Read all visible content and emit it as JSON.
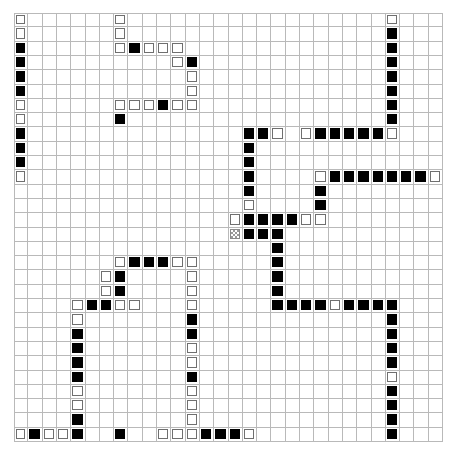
{
  "canvas": {
    "width": 457,
    "height": 463,
    "background": "#ffffff"
  },
  "grid": {
    "name": "puzzle-grid",
    "columns": 30,
    "rows": 30,
    "origin_x": 14,
    "origin_y": 13,
    "cell_size": 14.3,
    "line_color": "#b9b9b9",
    "legend": {
      "0": "empty",
      "1": "black-filled",
      "2": "white-outlined",
      "3": "gray-hatched"
    },
    "colors": {
      "black": "#000000",
      "white_fill": "#ffffff",
      "white_stroke": "#6f6f6f",
      "gray_hatch": "#9a9a9a",
      "gridline": "#b9b9b9"
    },
    "cells": [
      [
        2,
        0,
        0,
        0,
        0,
        0,
        0,
        2,
        0,
        0,
        0,
        0,
        0,
        0,
        0,
        0,
        0,
        0,
        0,
        0,
        0,
        0,
        0,
        0,
        0,
        0,
        2,
        0,
        0,
        0
      ],
      [
        2,
        0,
        0,
        0,
        0,
        0,
        0,
        2,
        0,
        0,
        0,
        0,
        0,
        0,
        0,
        0,
        0,
        0,
        0,
        0,
        0,
        0,
        0,
        0,
        0,
        0,
        1,
        0,
        0,
        0
      ],
      [
        1,
        0,
        0,
        0,
        0,
        0,
        0,
        2,
        1,
        2,
        2,
        2,
        0,
        0,
        0,
        0,
        0,
        0,
        0,
        0,
        0,
        0,
        0,
        0,
        0,
        0,
        1,
        0,
        0,
        0
      ],
      [
        1,
        0,
        0,
        0,
        0,
        0,
        0,
        0,
        0,
        0,
        0,
        2,
        1,
        0,
        0,
        0,
        0,
        0,
        0,
        0,
        0,
        0,
        0,
        0,
        0,
        0,
        1,
        0,
        0,
        0
      ],
      [
        1,
        0,
        0,
        0,
        0,
        0,
        0,
        0,
        0,
        0,
        0,
        0,
        2,
        0,
        0,
        0,
        0,
        0,
        0,
        0,
        0,
        0,
        0,
        0,
        0,
        0,
        1,
        0,
        0,
        0
      ],
      [
        1,
        0,
        0,
        0,
        0,
        0,
        0,
        0,
        0,
        0,
        0,
        0,
        2,
        0,
        0,
        0,
        0,
        0,
        0,
        0,
        0,
        0,
        0,
        0,
        0,
        0,
        1,
        0,
        0,
        0
      ],
      [
        2,
        0,
        0,
        0,
        0,
        0,
        0,
        2,
        2,
        2,
        1,
        2,
        2,
        0,
        0,
        0,
        0,
        0,
        0,
        0,
        0,
        0,
        0,
        0,
        0,
        0,
        1,
        0,
        0,
        0
      ],
      [
        2,
        0,
        0,
        0,
        0,
        0,
        0,
        1,
        0,
        0,
        0,
        0,
        0,
        0,
        0,
        0,
        0,
        0,
        0,
        0,
        0,
        0,
        0,
        0,
        0,
        0,
        1,
        0,
        0,
        0
      ],
      [
        1,
        0,
        0,
        0,
        0,
        0,
        0,
        0,
        0,
        0,
        0,
        0,
        0,
        0,
        0,
        0,
        1,
        1,
        2,
        0,
        2,
        1,
        1,
        1,
        1,
        1,
        2,
        0,
        0,
        0
      ],
      [
        1,
        0,
        0,
        0,
        0,
        0,
        0,
        0,
        0,
        0,
        0,
        0,
        0,
        0,
        0,
        0,
        1,
        0,
        0,
        0,
        0,
        0,
        0,
        0,
        0,
        0,
        0,
        0,
        0,
        0
      ],
      [
        1,
        0,
        0,
        0,
        0,
        0,
        0,
        0,
        0,
        0,
        0,
        0,
        0,
        0,
        0,
        0,
        1,
        0,
        0,
        0,
        0,
        0,
        0,
        0,
        0,
        0,
        0,
        0,
        0,
        0
      ],
      [
        2,
        0,
        0,
        0,
        0,
        0,
        0,
        0,
        0,
        0,
        0,
        0,
        0,
        0,
        0,
        0,
        1,
        0,
        0,
        0,
        0,
        2,
        1,
        1,
        1,
        1,
        1,
        1,
        1,
        2
      ],
      [
        0,
        0,
        0,
        0,
        0,
        0,
        0,
        0,
        0,
        0,
        0,
        0,
        0,
        0,
        0,
        0,
        1,
        0,
        0,
        0,
        0,
        1,
        0,
        0,
        0,
        0,
        0,
        0,
        0,
        0
      ],
      [
        0,
        0,
        0,
        0,
        0,
        0,
        0,
        0,
        0,
        0,
        0,
        0,
        0,
        0,
        0,
        0,
        2,
        0,
        0,
        0,
        0,
        1,
        0,
        0,
        0,
        0,
        0,
        0,
        0,
        0
      ],
      [
        0,
        0,
        0,
        0,
        0,
        0,
        0,
        0,
        0,
        0,
        0,
        0,
        0,
        0,
        0,
        2,
        1,
        1,
        1,
        1,
        2,
        2,
        0,
        0,
        0,
        0,
        0,
        0,
        0,
        0
      ],
      [
        0,
        0,
        0,
        0,
        0,
        0,
        0,
        0,
        0,
        0,
        0,
        0,
        0,
        0,
        0,
        3,
        1,
        1,
        1,
        0,
        0,
        0,
        0,
        0,
        0,
        0,
        0,
        0,
        0,
        0
      ],
      [
        0,
        0,
        0,
        0,
        0,
        0,
        0,
        0,
        0,
        0,
        0,
        0,
        0,
        0,
        0,
        0,
        0,
        0,
        1,
        0,
        0,
        0,
        0,
        0,
        0,
        0,
        0,
        0,
        0,
        0
      ],
      [
        0,
        0,
        0,
        0,
        0,
        0,
        0,
        2,
        1,
        1,
        1,
        2,
        2,
        0,
        0,
        0,
        0,
        0,
        1,
        0,
        0,
        0,
        0,
        0,
        0,
        0,
        0,
        0,
        0,
        0
      ],
      [
        0,
        0,
        0,
        0,
        0,
        0,
        2,
        1,
        0,
        0,
        0,
        0,
        2,
        0,
        0,
        0,
        0,
        0,
        1,
        0,
        0,
        0,
        0,
        0,
        0,
        0,
        0,
        0,
        0,
        0
      ],
      [
        0,
        0,
        0,
        0,
        0,
        0,
        2,
        1,
        0,
        0,
        0,
        0,
        2,
        0,
        0,
        0,
        0,
        0,
        1,
        0,
        0,
        0,
        0,
        0,
        0,
        0,
        0,
        0,
        0,
        0
      ],
      [
        0,
        0,
        0,
        0,
        2,
        1,
        1,
        2,
        2,
        0,
        0,
        0,
        2,
        0,
        0,
        0,
        0,
        0,
        1,
        1,
        1,
        1,
        2,
        1,
        1,
        1,
        1,
        0,
        0,
        0
      ],
      [
        0,
        0,
        0,
        0,
        2,
        0,
        0,
        0,
        0,
        0,
        0,
        0,
        1,
        0,
        0,
        0,
        0,
        0,
        0,
        0,
        0,
        0,
        0,
        0,
        0,
        0,
        1,
        0,
        0,
        0
      ],
      [
        0,
        0,
        0,
        0,
        1,
        0,
        0,
        0,
        0,
        0,
        0,
        0,
        1,
        0,
        0,
        0,
        0,
        0,
        0,
        0,
        0,
        0,
        0,
        0,
        0,
        0,
        1,
        0,
        0,
        0
      ],
      [
        0,
        0,
        0,
        0,
        1,
        0,
        0,
        0,
        0,
        0,
        0,
        0,
        2,
        0,
        0,
        0,
        0,
        0,
        0,
        0,
        0,
        0,
        0,
        0,
        0,
        0,
        1,
        0,
        0,
        0
      ],
      [
        0,
        0,
        0,
        0,
        1,
        0,
        0,
        0,
        0,
        0,
        0,
        0,
        2,
        0,
        0,
        0,
        0,
        0,
        0,
        0,
        0,
        0,
        0,
        0,
        0,
        0,
        1,
        0,
        0,
        0
      ],
      [
        0,
        0,
        0,
        0,
        1,
        0,
        0,
        0,
        0,
        0,
        0,
        0,
        1,
        0,
        0,
        0,
        0,
        0,
        0,
        0,
        0,
        0,
        0,
        0,
        0,
        0,
        2,
        0,
        0,
        0
      ],
      [
        0,
        0,
        0,
        0,
        2,
        0,
        0,
        0,
        0,
        0,
        0,
        0,
        2,
        0,
        0,
        0,
        0,
        0,
        0,
        0,
        0,
        0,
        0,
        0,
        0,
        0,
        1,
        0,
        0,
        0
      ],
      [
        0,
        0,
        0,
        0,
        2,
        0,
        0,
        0,
        0,
        0,
        0,
        0,
        2,
        0,
        0,
        0,
        0,
        0,
        0,
        0,
        0,
        0,
        0,
        0,
        0,
        0,
        1,
        0,
        0,
        0
      ],
      [
        0,
        0,
        0,
        0,
        1,
        0,
        0,
        0,
        0,
        0,
        0,
        0,
        2,
        0,
        0,
        0,
        0,
        0,
        0,
        0,
        0,
        0,
        0,
        0,
        0,
        0,
        1,
        0,
        0,
        0
      ],
      [
        0,
        0,
        0,
        0,
        1,
        0,
        0,
        0,
        0,
        0,
        2,
        2,
        2,
        1,
        1,
        1,
        2,
        0,
        0,
        0,
        0,
        0,
        0,
        0,
        0,
        0,
        1,
        0,
        0,
        0
      ]
    ],
    "extra_cells": [
      {
        "row": 29,
        "col": 0,
        "state": 2
      },
      {
        "row": 29,
        "col": 1,
        "state": 1
      },
      {
        "row": 29,
        "col": 2,
        "state": 2
      },
      {
        "row": 29,
        "col": 3,
        "state": 2
      },
      {
        "row": 29,
        "col": 7,
        "state": 1
      }
    ]
  }
}
